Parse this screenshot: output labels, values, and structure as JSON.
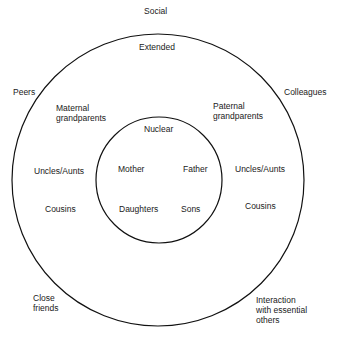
{
  "diagram": {
    "outer_label": "Social",
    "extended": {
      "title": "Extended",
      "maternal_grandparents": "Maternal\ngrandparents",
      "paternal_grandparents": "Paternal\ngrandparents",
      "uncles_aunts_left": "Uncles/Aunts",
      "uncles_aunts_right": "Uncles/Aunts",
      "cousins_left": "Cousins",
      "cousins_right": "Cousins"
    },
    "nuclear": {
      "title": "Nuclear",
      "mother": "Mother",
      "father": "Father",
      "daughters": "Daughters",
      "sons": "Sons"
    },
    "social": {
      "peers": "Peers",
      "colleagues": "Colleagues",
      "close_friends": "Close\nfriends",
      "interaction": "Interaction\nwith essential\nothers"
    },
    "colors": {
      "line": "#111111",
      "background": "#ffffff"
    }
  }
}
